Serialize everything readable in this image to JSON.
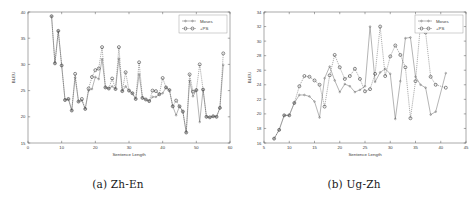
{
  "figure": {
    "background": "#ffffff",
    "accent": "#555555"
  },
  "subfigures": [
    {
      "caption": "(a) Zh-En",
      "caption_id": "caption-a"
    },
    {
      "caption": "(b) Ug-Zh",
      "caption_id": "caption-b"
    }
  ],
  "chart_data": [
    {
      "type": "line",
      "title": "",
      "subfigure_label": "(a) Zh-En",
      "xlabel": "Sentence Length",
      "ylabel": "BLEU",
      "xlim": [
        0,
        60
      ],
      "ylim": [
        15,
        40
      ],
      "xticks": [
        0,
        10,
        20,
        30,
        40,
        50,
        60
      ],
      "yticks": [
        15,
        20,
        25,
        30,
        35,
        40
      ],
      "grid": false,
      "legend_position": "upper right",
      "legend": [
        "Moses",
        "+PS"
      ],
      "x": [
        7,
        8,
        9,
        10,
        11,
        12,
        13,
        14,
        15,
        16,
        17,
        18,
        19,
        20,
        21,
        22,
        23,
        24,
        25,
        26,
        27,
        28,
        29,
        30,
        31,
        32,
        33,
        34,
        35,
        36,
        37,
        38,
        39,
        40,
        41,
        42,
        43,
        44,
        45,
        46,
        47,
        48,
        49,
        50,
        51,
        52,
        53,
        54,
        55,
        56,
        57,
        58
      ],
      "series": [
        {
          "name": "Moses",
          "values": [
            39.2,
            30.2,
            36.4,
            29.8,
            23.2,
            23.4,
            21.2,
            27.5,
            22.9,
            23.1,
            21.5,
            25.0,
            25.3,
            27.6,
            27.2,
            31.0,
            25.6,
            25.4,
            25.8,
            25.3,
            31.1,
            24.9,
            25.8,
            25.0,
            24.5,
            23.4,
            28.1,
            23.6,
            23.3,
            23.0,
            23.8,
            23.8,
            24.3,
            24.5,
            25.6,
            25.1,
            22.0,
            20.3,
            22.0,
            21.0,
            17.0,
            26.9,
            23.9,
            25.1,
            19.0,
            25.2,
            20.0,
            19.9,
            20.1,
            20.0,
            21.7,
            29.9
          ]
        },
        {
          "name": "+PS",
          "values": [
            39.2,
            30.2,
            36.4,
            29.8,
            23.2,
            23.4,
            21.2,
            28.2,
            22.9,
            23.4,
            21.5,
            25.4,
            27.6,
            28.9,
            29.2,
            33.3,
            25.6,
            25.4,
            27.3,
            25.3,
            33.3,
            24.9,
            28.5,
            25.0,
            24.5,
            23.4,
            30.4,
            23.6,
            23.3,
            23.0,
            25.0,
            24.9,
            24.3,
            27.4,
            25.6,
            25.1,
            22.0,
            23.1,
            22.0,
            21.0,
            17.0,
            28.1,
            24.8,
            25.1,
            30.0,
            25.2,
            20.0,
            19.9,
            20.1,
            20.0,
            21.7,
            32.1
          ]
        }
      ]
    },
    {
      "type": "line",
      "title": "",
      "subfigure_label": "(b) Ug-Zh",
      "xlabel": "Sentence Length",
      "ylabel": "BLEU",
      "xlim": [
        5,
        45
      ],
      "ylim": [
        16,
        34
      ],
      "xticks": [
        5,
        10,
        15,
        20,
        25,
        30,
        35,
        40,
        45
      ],
      "yticks": [
        16,
        18,
        20,
        22,
        24,
        26,
        28,
        30,
        32,
        34
      ],
      "grid": false,
      "legend_position": "upper right",
      "legend": [
        "Moses",
        "+PS"
      ],
      "x": [
        7,
        8,
        9,
        10,
        11,
        12,
        13,
        14,
        15,
        16,
        17,
        18,
        19,
        20,
        21,
        22,
        23,
        24,
        25,
        26,
        27,
        28,
        29,
        30,
        31,
        32,
        33,
        34,
        35,
        36,
        37,
        38,
        39,
        41
      ],
      "series": [
        {
          "name": "Moses",
          "values": [
            16.6,
            17.8,
            19.8,
            19.8,
            21.5,
            22.6,
            22.6,
            22.4,
            21.7,
            19.5,
            24.9,
            26.5,
            24.6,
            23.0,
            24.1,
            23.8,
            23.0,
            23.3,
            23.8,
            32.0,
            24.4,
            25.7,
            26.2,
            25.5,
            19.3,
            24.5,
            30.4,
            30.5,
            25.1,
            24.0,
            23.6,
            19.9,
            20.3,
            25.6
          ]
        },
        {
          "name": "+PS",
          "values": [
            16.6,
            17.8,
            19.8,
            19.8,
            21.5,
            23.8,
            25.2,
            25.1,
            24.6,
            24.0,
            21.0,
            25.3,
            28.1,
            26.4,
            24.8,
            25.2,
            26.2,
            24.8,
            23.1,
            23.4,
            25.5,
            32.0,
            25.2,
            27.9,
            29.4,
            28.1,
            26.4,
            19.4,
            24.5,
            32.4,
            31.2,
            25.1,
            24.0,
            23.6,
            20.5,
            25.6
          ]
        }
      ]
    }
  ]
}
